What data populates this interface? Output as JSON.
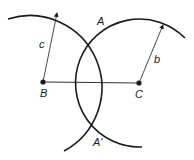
{
  "diagram": {
    "points": {
      "B": {
        "label": "B"
      },
      "C": {
        "label": "C"
      },
      "A": {
        "label": "A"
      },
      "A_prime": {
        "label": "A'"
      }
    },
    "radii": {
      "c": {
        "label": "c",
        "center": "B"
      },
      "b": {
        "label": "b",
        "center": "C"
      }
    },
    "colors": {
      "stroke": "#1a1a1a",
      "background": "#ffffff"
    }
  }
}
